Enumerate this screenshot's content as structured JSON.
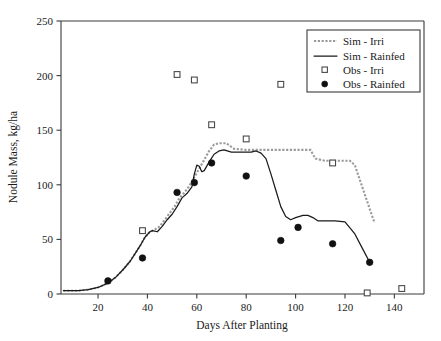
{
  "chart_data": {
    "type": "line",
    "title": "",
    "xlabel": "Days After Planting",
    "ylabel": "Nodule Mass, kg/ha",
    "xlim": [
      5,
      152
    ],
    "ylim": [
      0,
      250
    ],
    "xticks": [
      20,
      40,
      60,
      80,
      100,
      120,
      140
    ],
    "yticks": [
      0,
      50,
      100,
      150,
      200,
      250
    ],
    "grid": false,
    "legend_position": "top-right",
    "legend": [
      "Sim - Irri",
      "Sim - Rainfed",
      "Obs - Irri",
      "Obs - Rainfed"
    ],
    "series": [
      {
        "name": "Sim - Irri",
        "type": "line",
        "style": "dashed",
        "color": "#9a9a9a",
        "points": [
          [
            6,
            3
          ],
          [
            12,
            3
          ],
          [
            16,
            4
          ],
          [
            20,
            6
          ],
          [
            24,
            10
          ],
          [
            27,
            15
          ],
          [
            30,
            22
          ],
          [
            33,
            30
          ],
          [
            35,
            37
          ],
          [
            37,
            44
          ],
          [
            39,
            52
          ],
          [
            41,
            57
          ],
          [
            43,
            59
          ],
          [
            45,
            62
          ],
          [
            47,
            68
          ],
          [
            49,
            74
          ],
          [
            51,
            80
          ],
          [
            53,
            88
          ],
          [
            55,
            93
          ],
          [
            57,
            99
          ],
          [
            59,
            107
          ],
          [
            61,
            115
          ],
          [
            63,
            123
          ],
          [
            65,
            131
          ],
          [
            67,
            137
          ],
          [
            69,
            138
          ],
          [
            72,
            138
          ],
          [
            75,
            133
          ],
          [
            80,
            132
          ],
          [
            90,
            132
          ],
          [
            100,
            132
          ],
          [
            106,
            132
          ],
          [
            108,
            124
          ],
          [
            112,
            122
          ],
          [
            118,
            122
          ],
          [
            122,
            122
          ],
          [
            124,
            118
          ],
          [
            127,
            98
          ],
          [
            130,
            78
          ],
          [
            132,
            65
          ]
        ]
      },
      {
        "name": "Sim - Rainfed",
        "type": "line",
        "style": "solid",
        "color": "#1a1a1a",
        "points": [
          [
            6,
            3
          ],
          [
            12,
            3
          ],
          [
            16,
            4
          ],
          [
            20,
            6
          ],
          [
            24,
            10
          ],
          [
            27,
            15
          ],
          [
            30,
            22
          ],
          [
            33,
            30
          ],
          [
            35,
            37
          ],
          [
            37,
            44
          ],
          [
            39,
            52
          ],
          [
            41,
            57
          ],
          [
            42,
            58
          ],
          [
            44,
            57
          ],
          [
            46,
            62
          ],
          [
            48,
            68
          ],
          [
            50,
            73
          ],
          [
            52,
            80
          ],
          [
            54,
            88
          ],
          [
            56,
            92
          ],
          [
            58,
            98
          ],
          [
            59,
            110
          ],
          [
            60,
            118
          ],
          [
            61,
            117
          ],
          [
            62,
            112
          ],
          [
            63,
            113
          ],
          [
            65,
            121
          ],
          [
            67,
            128
          ],
          [
            69,
            131
          ],
          [
            71,
            132
          ],
          [
            74,
            130
          ],
          [
            78,
            130
          ],
          [
            82,
            130
          ],
          [
            84,
            131
          ],
          [
            86,
            129
          ],
          [
            88,
            124
          ],
          [
            90,
            110
          ],
          [
            92,
            95
          ],
          [
            94,
            80
          ],
          [
            96,
            71
          ],
          [
            98,
            68
          ],
          [
            100,
            70
          ],
          [
            103,
            72
          ],
          [
            105,
            72
          ],
          [
            107,
            70
          ],
          [
            109,
            67
          ],
          [
            112,
            67
          ],
          [
            116,
            67
          ],
          [
            120,
            66
          ],
          [
            124,
            55
          ],
          [
            127,
            42
          ],
          [
            130,
            29
          ]
        ]
      },
      {
        "name": "Obs - Irri",
        "type": "scatter",
        "marker": "open-square",
        "color": "#4a4a4a",
        "points": [
          [
            38,
            58
          ],
          [
            52,
            201
          ],
          [
            59,
            196
          ],
          [
            66,
            155
          ],
          [
            80,
            142
          ],
          [
            94,
            192
          ],
          [
            115,
            120
          ],
          [
            129,
            1
          ],
          [
            143,
            5
          ]
        ]
      },
      {
        "name": "Obs - Rainfed",
        "type": "scatter",
        "marker": "filled-circle",
        "color": "#111111",
        "points": [
          [
            24,
            12
          ],
          [
            38,
            33
          ],
          [
            52,
            93
          ],
          [
            59,
            102
          ],
          [
            66,
            120
          ],
          [
            80,
            108
          ],
          [
            94,
            49
          ],
          [
            101,
            61
          ],
          [
            115,
            46
          ],
          [
            130,
            29
          ]
        ]
      }
    ]
  },
  "colors": {
    "sim_irri": "#9a9a9a",
    "sim_rainfed": "#1a1a1a",
    "obs_irri": "#4a4a4a",
    "obs_rainfed": "#111111",
    "axis": "#3a3a3a",
    "background": "#ffffff"
  }
}
